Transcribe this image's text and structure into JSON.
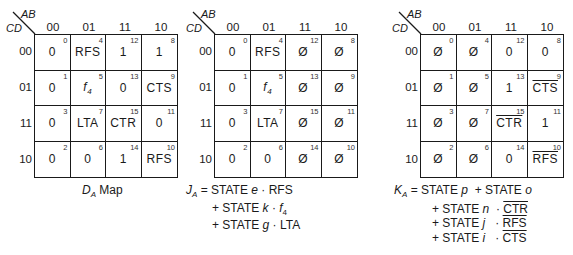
{
  "axes": {
    "row_var": "CD",
    "col_var": "AB",
    "col_labels": [
      "00",
      "01",
      "11",
      "10"
    ],
    "row_labels": [
      "00",
      "01",
      "11",
      "10"
    ]
  },
  "maps": [
    {
      "id": "DA",
      "caption_main": "D",
      "caption_sub": "A",
      "caption_tail": "Map",
      "cells": [
        [
          {
            "idx": "0",
            "val": "0"
          },
          {
            "idx": "4",
            "val": "RFS"
          },
          {
            "idx": "12",
            "val": "1"
          },
          {
            "idx": "8",
            "val": "1"
          }
        ],
        [
          {
            "idx": "1",
            "val": "0"
          },
          {
            "idx": "5",
            "val": "f4"
          },
          {
            "idx": "13",
            "val": "0"
          },
          {
            "idx": "9",
            "val": "CTS"
          }
        ],
        [
          {
            "idx": "3",
            "val": "0"
          },
          {
            "idx": "7",
            "val": "LTA"
          },
          {
            "idx": "15",
            "val": "CTR"
          },
          {
            "idx": "11",
            "val": "0"
          }
        ],
        [
          {
            "idx": "2",
            "val": "0"
          },
          {
            "idx": "6",
            "val": "0"
          },
          {
            "idx": "14",
            "val": "1"
          },
          {
            "idx": "10",
            "val": "RFS"
          }
        ]
      ]
    },
    {
      "id": "JA",
      "cells": [
        [
          {
            "idx": "0",
            "val": "0"
          },
          {
            "idx": "4",
            "val": "RFS"
          },
          {
            "idx": "12",
            "val": "Ø"
          },
          {
            "idx": "8",
            "val": "Ø"
          }
        ],
        [
          {
            "idx": "1",
            "val": "0"
          },
          {
            "idx": "5",
            "val": "f4"
          },
          {
            "idx": "13",
            "val": "Ø"
          },
          {
            "idx": "9",
            "val": "Ø"
          }
        ],
        [
          {
            "idx": "3",
            "val": "0"
          },
          {
            "idx": "7",
            "val": "LTA"
          },
          {
            "idx": "15",
            "val": "Ø"
          },
          {
            "idx": "11",
            "val": "Ø"
          }
        ],
        [
          {
            "idx": "2",
            "val": "0"
          },
          {
            "idx": "6",
            "val": "0"
          },
          {
            "idx": "14",
            "val": "Ø"
          },
          {
            "idx": "10",
            "val": "Ø"
          }
        ]
      ],
      "equation": {
        "lhs_main": "J",
        "lhs_sub": "A",
        "terms": [
          {
            "prefix": "= STATE",
            "state": "e",
            "dot": "·",
            "signal": "RFS",
            "signal_sub": "",
            "negated": false
          },
          {
            "prefix": "+ STATE",
            "state": "k",
            "dot": "·",
            "signal": "f",
            "signal_sub": "4",
            "negated": false
          },
          {
            "prefix": "+ STATE",
            "state": "g",
            "dot": "·",
            "signal": "LTA",
            "signal_sub": "",
            "negated": false
          }
        ]
      }
    },
    {
      "id": "KA",
      "cells": [
        [
          {
            "idx": "0",
            "val": "Ø"
          },
          {
            "idx": "4",
            "val": "Ø"
          },
          {
            "idx": "12",
            "val": "0"
          },
          {
            "idx": "8",
            "val": "0"
          }
        ],
        [
          {
            "idx": "1",
            "val": "Ø"
          },
          {
            "idx": "5",
            "val": "Ø"
          },
          {
            "idx": "13",
            "val": "1"
          },
          {
            "idx": "9",
            "val": "CTS",
            "negated": true
          }
        ],
        [
          {
            "idx": "3",
            "val": "Ø"
          },
          {
            "idx": "7",
            "val": "Ø"
          },
          {
            "idx": "15",
            "val": "CTR",
            "negated": true
          },
          {
            "idx": "11",
            "val": "1"
          }
        ],
        [
          {
            "idx": "2",
            "val": "Ø"
          },
          {
            "idx": "6",
            "val": "Ø"
          },
          {
            "idx": "14",
            "val": "0"
          },
          {
            "idx": "10",
            "val": "RFS",
            "negated": true
          }
        ]
      ],
      "equation": {
        "lhs_main": "K",
        "lhs_sub": "A",
        "line1": {
          "prefix1": "= STATE",
          "state1": "p",
          "prefix2": "+ STATE",
          "state2": "o"
        },
        "terms": [
          {
            "prefix": "+ STATE",
            "state": "n",
            "dot": "·",
            "signal": "CTR",
            "negated": true
          },
          {
            "prefix": "+ STATE",
            "state": "j",
            "dot": "·",
            "signal": "RFS",
            "negated": true
          },
          {
            "prefix": "+ STATE",
            "state": "i",
            "dot": "·",
            "signal": "CTS",
            "negated": true
          }
        ]
      }
    }
  ]
}
